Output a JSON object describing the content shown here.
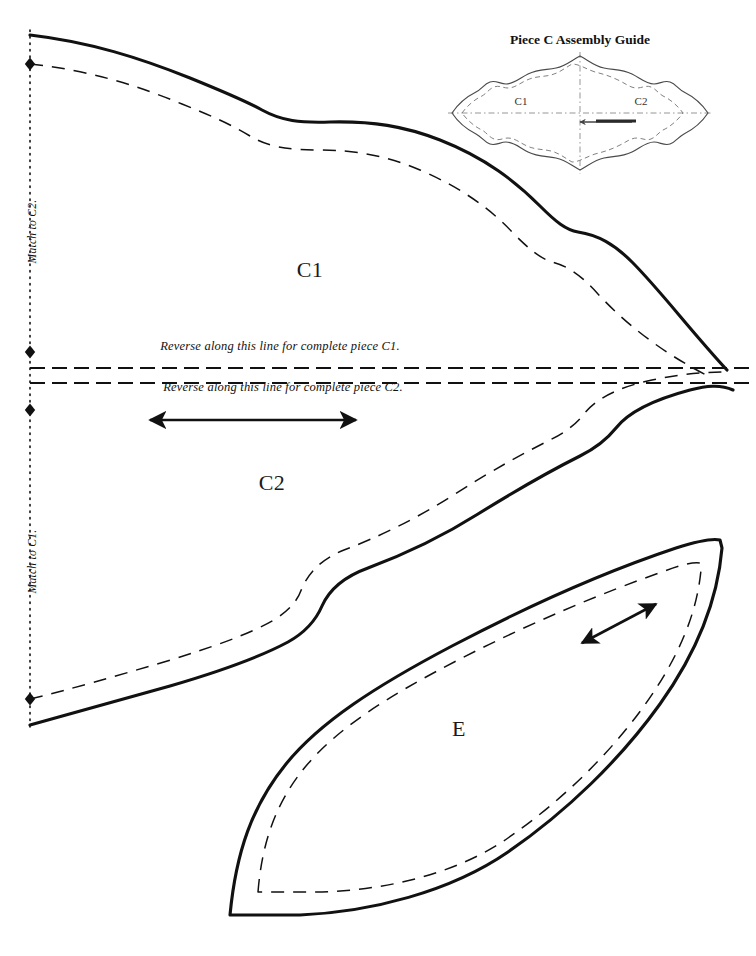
{
  "sheet": {
    "width": 756,
    "height": 956,
    "background": "#ffffff",
    "ink": "#111111",
    "thumb_ink": "#5a5a5a"
  },
  "pieces": {
    "c1": {
      "label": "C1",
      "label_x": 310,
      "label_y": 270,
      "cut_line": "M 30 35 C 90 42 140 58 190 78 C 222 91 246 101 262 110 C 282 121 300 123 330 122 C 372 121 404 126 440 140 C 486 158 516 182 540 206 C 556 222 566 230 578 232 C 598 235 614 244 632 262 C 660 290 690 330 727 370",
      "seam_line": "M 30 64 C 88 70 136 85 182 104 C 212 116 234 126 250 136 C 268 147 288 150 318 150 C 356 150 388 156 420 170 C 462 188 492 210 514 234 C 530 250 540 258 552 262 C 568 266 582 276 598 294 C 624 322 660 352 712 378"
    },
    "c2": {
      "label": "C2",
      "label_x": 272,
      "label_y": 483,
      "cut_line": "M 30 725 C 70 714 120 700 170 686 C 218 672 262 656 288 642 C 306 632 316 620 322 606 C 330 588 346 576 368 568 C 400 556 440 538 478 514 C 520 488 556 468 580 456 C 598 447 608 438 616 428 C 630 410 660 398 690 390 C 706 386 720 384 733 390",
      "seam_line": "M 30 699 C 68 690 116 676 164 662 C 210 648 250 634 274 620 C 290 610 298 600 302 588 C 310 570 324 558 344 550 C 376 538 414 520 452 496 C 492 470 526 452 550 440 C 566 432 576 424 584 414 C 598 396 624 386 652 380 C 676 375 700 372 727 372"
    },
    "e": {
      "label": "E",
      "label_x": 459,
      "label_y": 729,
      "cut_line": "M 230 915 C 236 852 252 806 286 764 C 320 722 376 686 452 646 C 528 606 610 570 676 548 C 698 541 712 538 720 540 L 722 548 C 718 596 700 648 660 704 C 620 760 566 812 508 852 C 450 892 370 912 300 915 Z",
      "seam_line": "M 258 892 C 262 842 276 802 306 766 C 338 728 388 696 458 660 C 528 624 604 592 662 572 C 680 565 692 562 700 563 L 701 570 C 697 612 680 656 644 706 C 608 756 560 802 508 838 C 456 874 386 890 322 892 Z"
    }
  },
  "fold_line": {
    "x": 30,
    "top": 30,
    "bottom": 730,
    "style": "dotted"
  },
  "markers": [
    {
      "name": "notch-diamond-top",
      "x": 30,
      "y": 64
    },
    {
      "name": "notch-diamond-c1-bottom",
      "x": 30,
      "y": 352
    },
    {
      "name": "notch-diamond-c2-top",
      "x": 30,
      "y": 410
    },
    {
      "name": "notch-diamond-bottom",
      "x": 30,
      "y": 699
    }
  ],
  "reverse_lines": [
    {
      "name": "reverse-line-c1",
      "text": "Reverse along this line for complete piece C1.",
      "text_x": 280,
      "text_y": 352,
      "y": 368,
      "x1": 30,
      "x2": 752
    },
    {
      "name": "reverse-line-c2",
      "text": "Reverse along this line for complete piece C2.",
      "text_x": 283,
      "text_y": 393,
      "y": 383,
      "x1": 30,
      "x2": 752
    }
  ],
  "match_notes": [
    {
      "name": "match-to-c2",
      "text": "Match to C2.",
      "x": 38,
      "y": 252
    },
    {
      "name": "match-to-c1",
      "text": "Match to C1.",
      "x": 38,
      "y": 582
    }
  ],
  "grain_arrows": [
    {
      "name": "grain-arrow-c2",
      "x1": 150,
      "y1": 420,
      "x2": 356,
      "y2": 420,
      "double": true
    },
    {
      "name": "grain-arrow-e",
      "x1": 582,
      "y1": 643,
      "x2": 656,
      "y2": 604,
      "double": true
    }
  ],
  "assembly_guide": {
    "title": "Piece C Assembly Guide",
    "title_x": 580,
    "title_y": 40,
    "left_label": "C1",
    "left_label_x": 521,
    "left_label_y": 101,
    "right_label": "C2",
    "right_label_x": 641,
    "right_label_y": 101,
    "cut_line": "M 452 113 C 458 104 468 96 476 92 C 482 89 484 84 490 82 C 496 80 500 84 506 84 C 514 84 520 78 528 74 C 538 69 546 70 556 68 C 566 66 572 60 580 56 C 588 60 594 66 604 68 C 614 70 622 69 632 74 C 640 78 646 84 654 84 C 660 84 664 80 670 82 C 676 84 678 89 684 92 C 692 96 702 104 708 113 C 702 122 692 130 684 134 C 678 137 676 142 670 144 C 664 146 660 142 654 142 C 646 142 640 148 632 152 C 622 157 614 156 604 158 C 594 160 588 166 580 170 C 572 166 566 160 556 158 C 546 156 538 157 528 152 C 520 148 514 142 506 142 C 500 142 496 146 490 144 C 484 142 482 137 476 134 C 468 130 458 122 452 113 Z",
    "seam_line": "M 462 113 C 467 106 475 99 482 96 C 487 93 489 89 494 87 C 499 85 503 88 508 88 C 515 88 520 83 527 80 C 536 76 543 77 551 75 C 559 73 565 68 572 64 C 579 64 586 69 595 72 C 603 74 610 76 618 80 C 625 83 630 88 637 88 C 642 88 646 85 651 87 C 656 89 658 93 663 96 C 670 99 678 106 683 113 C 678 120 670 127 663 130 C 658 133 656 137 651 139 C 646 141 642 138 637 138 C 630 138 625 143 618 146 C 610 150 603 152 595 154 C 586 157 579 162 572 162 C 565 158 559 153 551 151 C 543 149 536 150 527 146 C 520 143 515 138 508 138 C 503 138 499 141 494 139 C 489 137 487 133 482 130 C 475 127 467 120 462 113 Z",
    "axis_h": {
      "x1": 448,
      "y1": 113,
      "x2": 712,
      "y2": 113
    },
    "axis_v": {
      "x1": 580,
      "y1": 52,
      "x2": 580,
      "y2": 174
    },
    "arrow": {
      "x1": 632,
      "y1": 122,
      "x2": 580,
      "y2": 122
    },
    "bar": {
      "x1": 596,
      "y1": 121,
      "x2": 636,
      "y2": 121
    }
  }
}
